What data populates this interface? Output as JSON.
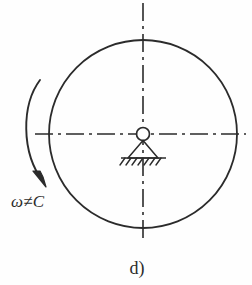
{
  "figure": {
    "caption": "d)",
    "angular_velocity_label": "ω≠C",
    "stroke_color": "#2b2b2b",
    "background_color": "#fefefe",
    "disk": {
      "center_x": 143,
      "center_y": 134,
      "radius": 94
    },
    "hinge": {
      "center_x": 143,
      "center_y": 134,
      "radius": 6.5
    },
    "support": {
      "apex_x": 143,
      "apex_y": 140,
      "base_left_x": 128,
      "base_right_x": 158,
      "base_y": 158,
      "ground_left_x": 121,
      "ground_right_x": 166,
      "hatch_count": 7
    },
    "axes": {
      "horizontal": {
        "x1": 35,
        "x2": 246,
        "y": 134
      },
      "vertical": {
        "x": 143,
        "y1": 3,
        "y2": 238
      },
      "dash_pattern": "18 5 3 5"
    },
    "rotation_arrow": {
      "direction": "counterclockwise-downward",
      "start_x": 40,
      "start_y": 80,
      "end_x": 45,
      "end_y": 184
    }
  }
}
